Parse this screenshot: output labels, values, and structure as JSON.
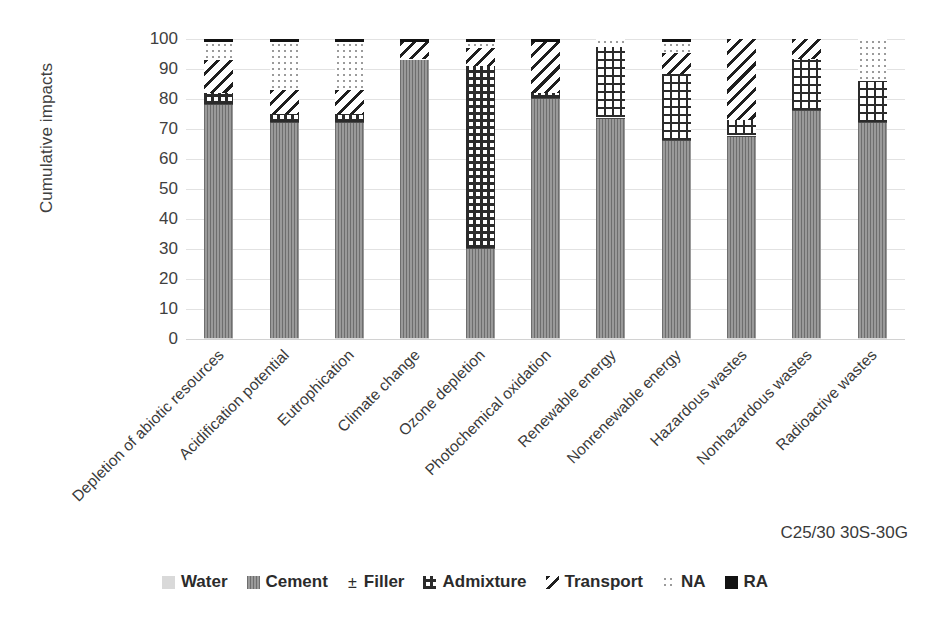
{
  "chart_data": {
    "type": "bar",
    "subtype": "stacked-100-percent",
    "title": "",
    "xlabel": "",
    "ylabel": "Cumulative impacts",
    "ylim": [
      0,
      100
    ],
    "yticks": [
      0,
      10,
      20,
      30,
      40,
      50,
      60,
      70,
      80,
      90,
      100
    ],
    "grid": true,
    "legend_position": "bottom",
    "annotation": "C25/30 30S-30G",
    "categories": [
      "Depletion of abiotic resources",
      "Acidification potential",
      "Eutrophication",
      "Climate change",
      "Ozone depletion",
      "Photochemical oxidation",
      "Renewable energy",
      "Nonrenewable energy",
      "Hazardous wastes",
      "Nonhazardous wastes",
      "Radioactive wastes"
    ],
    "series": [
      {
        "name": "Water",
        "pattern": "solid-light-gray",
        "color": "#d9d9d9",
        "values": [
          0.3,
          0.3,
          0.3,
          0.2,
          0.2,
          0.3,
          0.3,
          0.3,
          0.3,
          0.3,
          0.3
        ]
      },
      {
        "name": "Cement",
        "pattern": "vertical-lines",
        "color": "#8c8c8c",
        "values": [
          77.7,
          71.7,
          71.7,
          92.8,
          29.8,
          79.7,
          73.2,
          65.7,
          67.2,
          75.7,
          71.7
        ]
      },
      {
        "name": "Filler",
        "pattern": "horizontal-lines",
        "color": "#ffffff",
        "values": [
          0.5,
          0.5,
          0.5,
          0.3,
          0.5,
          0.5,
          0.5,
          0.5,
          0.5,
          0.5,
          0.5
        ]
      },
      {
        "name": "Admixture",
        "pattern": "checkerboard",
        "color": "#2b2b2b",
        "values": [
          3.5,
          2.5,
          2.5,
          0.2,
          60.5,
          1.5,
          23.5,
          22.0,
          5.0,
          17.0,
          13.5
        ]
      },
      {
        "name": "Transport",
        "pattern": "diagonal-hatch",
        "color": "#1f1f1f",
        "values": [
          11.0,
          8.0,
          8.0,
          5.5,
          6.0,
          17.0,
          0.0,
          7.0,
          27.0,
          6.5,
          0.0
        ]
      },
      {
        "name": "NA",
        "pattern": "dots",
        "color": "#9b9b9b",
        "values": [
          6.0,
          16.0,
          16.0,
          0.0,
          2.0,
          0.0,
          2.5,
          3.5,
          0.0,
          0.0,
          14.0
        ]
      },
      {
        "name": "RA",
        "pattern": "solid-black",
        "color": "#121212",
        "values": [
          1.0,
          1.0,
          1.0,
          1.0,
          1.0,
          1.0,
          0.0,
          1.0,
          0.0,
          0.0,
          0.0
        ]
      }
    ]
  },
  "axis": {
    "y_title": "Cumulative impacts",
    "y_tick_labels": [
      "0",
      "10",
      "20",
      "30",
      "40",
      "50",
      "60",
      "70",
      "80",
      "90",
      "100"
    ]
  },
  "legend": {
    "items": [
      {
        "label": "Water",
        "swatch": "water-swatch"
      },
      {
        "label": "Cement",
        "swatch": "cement-swatch"
      },
      {
        "label": "Filler",
        "swatch": "filler-swatch"
      },
      {
        "label": "Admixture",
        "swatch": "admixture-swatch"
      },
      {
        "label": "Transport",
        "swatch": "transport-swatch"
      },
      {
        "label": "NA",
        "swatch": "na-swatch"
      },
      {
        "label": "RA",
        "swatch": "ra-swatch"
      }
    ]
  },
  "annotation": {
    "mix_label": "C25/30 30S-30G"
  }
}
